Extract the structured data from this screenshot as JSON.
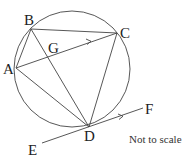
{
  "diagram": {
    "type": "circle-geometry",
    "colors": {
      "stroke": "#444444",
      "text": "#222222",
      "background": "#ffffff"
    },
    "circle": {
      "cx": 72,
      "cy": 69,
      "r": 58
    },
    "points": {
      "A": {
        "label": "A",
        "x": 16,
        "y": 68
      },
      "B": {
        "label": "B",
        "x": 31,
        "y": 29
      },
      "C": {
        "label": "C",
        "x": 117,
        "y": 33
      },
      "D": {
        "label": "D",
        "x": 89,
        "y": 127
      },
      "E": {
        "label": "E",
        "x": 42,
        "y": 143
      },
      "F": {
        "label": "F",
        "x": 143,
        "y": 108
      },
      "G": {
        "label": "G",
        "x": 48,
        "y": 56
      }
    },
    "segments": [
      "AB",
      "BC",
      "AC",
      "AD",
      "BD",
      "CD",
      "EF"
    ],
    "parallel_marks": [
      "AC",
      "EF"
    ],
    "tangent": "EF at D",
    "note": "Not to scale"
  }
}
